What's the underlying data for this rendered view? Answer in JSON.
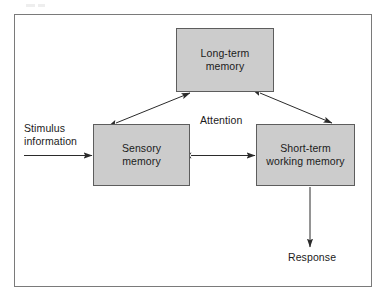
{
  "diagram": {
    "frame": {
      "border_color": "#7a7a7a",
      "background": "#ffffff"
    },
    "style": {
      "box_fill": "#cccccc",
      "box_border": "#5d5d5d",
      "text_color": "#1b1b1b",
      "arrow_color": "#2b2b2b"
    },
    "nodes": [
      {
        "id": "long-term-memory",
        "label": "Long-term\nmemory",
        "x": 176,
        "y": 28,
        "width": 98,
        "height": 64
      },
      {
        "id": "sensory-memory",
        "label": "Sensory\nmemory",
        "x": 93,
        "y": 124,
        "width": 97,
        "height": 62
      },
      {
        "id": "short-term-working-memory",
        "label": "Short-term\nworking memory",
        "x": 256,
        "y": 124,
        "width": 99,
        "height": 62
      }
    ],
    "labels": [
      {
        "id": "stimulus-information",
        "text": "Stimulus\ninformation",
        "x": 24,
        "y": 122
      },
      {
        "id": "attention",
        "text": "Attention",
        "x": 200,
        "y": 114
      },
      {
        "id": "response",
        "text": "Response",
        "x": 288,
        "y": 251
      }
    ],
    "connectors": [
      {
        "id": "stimulus-to-sensory",
        "from": "stimulus-information",
        "to": "sensory-memory",
        "arrowheads": "end",
        "orientation": "horizontal"
      },
      {
        "id": "sensory-to-long-term",
        "from": "sensory-memory",
        "to": "long-term-memory",
        "arrowheads": "both",
        "orientation": "diagonal"
      },
      {
        "id": "long-term-to-short-term",
        "from": "long-term-memory",
        "to": "short-term-working-memory",
        "arrowheads": "both",
        "orientation": "diagonal"
      },
      {
        "id": "sensory-to-short-term",
        "from": "sensory-memory",
        "to": "short-term-working-memory",
        "arrowheads": "both",
        "orientation": "horizontal"
      },
      {
        "id": "short-term-to-response",
        "from": "short-term-working-memory",
        "to": "response",
        "arrowheads": "end",
        "orientation": "vertical"
      }
    ]
  }
}
